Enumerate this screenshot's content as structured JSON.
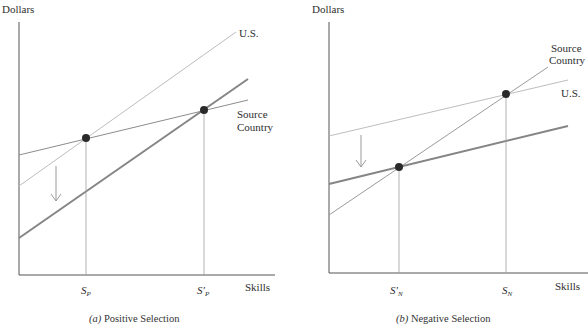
{
  "panels": [
    {
      "id": "a",
      "y_axis_label": "Dollars",
      "x_axis_label": "Skills",
      "caption_letter": "(a)",
      "caption_text": " Positive Selection",
      "line_labels": {
        "us": "U.S.",
        "source_line1": "Source",
        "source_line2": "Country"
      },
      "tick_labels": [
        {
          "main": "S",
          "prime": "",
          "sub": "P"
        },
        {
          "main": "S",
          "prime": "′",
          "sub": "P"
        }
      ]
    },
    {
      "id": "b",
      "y_axis_label": "Dollars",
      "x_axis_label": "Skills",
      "caption_letter": "(b)",
      "caption_text": " Negative Selection",
      "line_labels": {
        "us": "U.S.",
        "source_line1": "Source",
        "source_line2": "Country"
      },
      "tick_labels": [
        {
          "main": "S",
          "prime": "′",
          "sub": "N"
        },
        {
          "main": "S",
          "prime": "",
          "sub": "N"
        }
      ]
    }
  ],
  "colors": {
    "axis": "#555555",
    "light_line": "#b8b8b8",
    "medium_line": "#8a8a8a",
    "thick_line": "#7a7a7a",
    "dot": "#2a2a2a",
    "arrow": "#9a9a9a"
  }
}
